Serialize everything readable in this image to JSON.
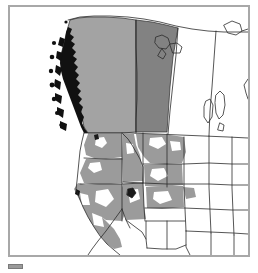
{
  "figure": {
    "type": "distribution-range-map",
    "region": "Western North America",
    "background_color": "#ffffff",
    "frame_color": "#a8a8a8",
    "outline_color": "#2b2b2b"
  },
  "legend": {
    "swatch_color": "#9a9a9a",
    "label": ""
  },
  "palette": {
    "shade_light": "#a3a3a3",
    "shade_dark": "#828282",
    "shade_patch": "#9b9b9b",
    "coast_detail": "#111111",
    "unshaded": "#ffffff",
    "border_line": "#2b2b2b",
    "frame": "#a8a8a8"
  },
  "map_features": {
    "shaded_regions": [
      {
        "name": "British Columbia",
        "country": "Canada",
        "shade": "light"
      },
      {
        "name": "Alberta",
        "country": "Canada",
        "shade": "dark"
      },
      {
        "name": "Washington",
        "country": "United States",
        "shade": "patch"
      },
      {
        "name": "Oregon",
        "country": "United States",
        "shade": "patch"
      },
      {
        "name": "Idaho",
        "country": "United States",
        "shade": "patch"
      },
      {
        "name": "Montana",
        "country": "United States",
        "shade": "patch"
      },
      {
        "name": "Wyoming",
        "country": "United States",
        "shade": "patch"
      },
      {
        "name": "Nevada",
        "country": "United States",
        "shade": "patch"
      },
      {
        "name": "Utah",
        "country": "United States",
        "shade": "patch"
      },
      {
        "name": "California",
        "country": "United States",
        "shade": "patch"
      },
      {
        "name": "Colorado",
        "country": "United States",
        "shade": "patch"
      }
    ],
    "unshaded_regions": [
      {
        "name": "Saskatchewan",
        "country": "Canada"
      },
      {
        "name": "Manitoba",
        "country": "Canada"
      },
      {
        "name": "North Dakota",
        "country": "United States"
      },
      {
        "name": "South Dakota",
        "country": "United States"
      },
      {
        "name": "Nebraska",
        "country": "United States"
      },
      {
        "name": "Kansas",
        "country": "United States"
      },
      {
        "name": "Arizona",
        "country": "United States"
      },
      {
        "name": "New Mexico",
        "country": "United States"
      },
      {
        "name": "Oklahoma",
        "country": "United States"
      },
      {
        "name": "Texas",
        "country": "United States"
      }
    ]
  }
}
